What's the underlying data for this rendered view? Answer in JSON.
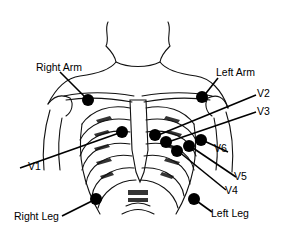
{
  "diagram": {
    "labels": {
      "right_arm": "Right Arm",
      "left_arm": "Left Arm",
      "right_leg": "Right Leg",
      "left_leg": "Left Leg",
      "v1": "V1",
      "v2": "V2",
      "v3": "V3",
      "v4": "V4",
      "v5": "V5",
      "v6": "V6"
    },
    "colors": {
      "electrode": "#000000",
      "line": "#000000",
      "background": "#ffffff"
    }
  }
}
